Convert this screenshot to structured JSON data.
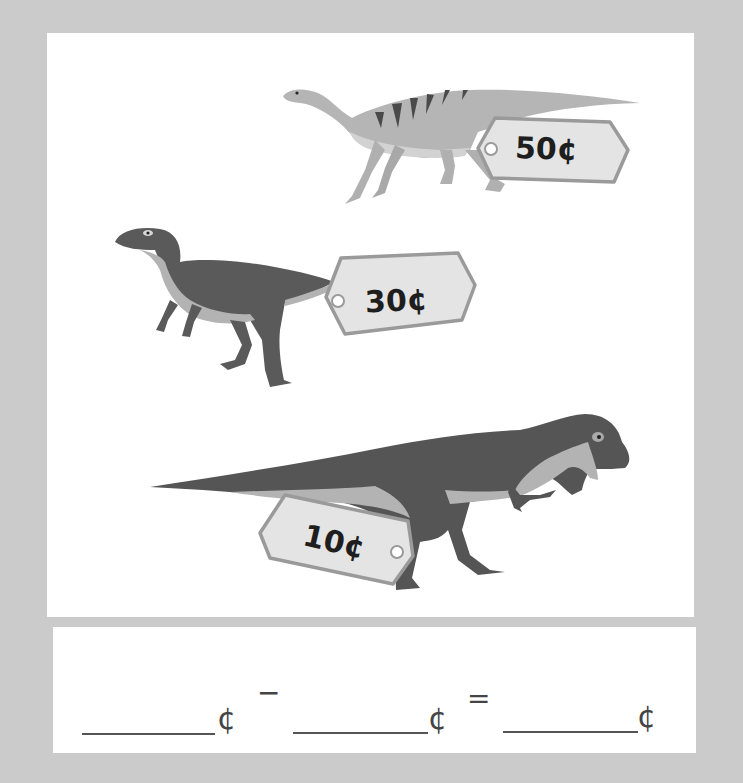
{
  "worksheet": {
    "dinosaurs": [
      {
        "name": "striped-long-neck-dinosaur",
        "price_tag": "50¢",
        "value": 50,
        "color": "#b3b3b3"
      },
      {
        "name": "small-raptor-dinosaur",
        "price_tag": "30¢",
        "value": 30,
        "color": "#5a5a5a"
      },
      {
        "name": "tyrannosaurus",
        "price_tag": "10¢",
        "value": 10,
        "color": "#555555"
      }
    ],
    "equation": {
      "blank1_unit": "¢",
      "operator": "−",
      "blank2_unit": "¢",
      "equals": "=",
      "blank3_unit": "¢"
    },
    "colors": {
      "background": "#cbcbcb",
      "panel": "#ffffff",
      "tag_fill": "#e4e4e4",
      "tag_border": "#9a9a9a"
    }
  }
}
